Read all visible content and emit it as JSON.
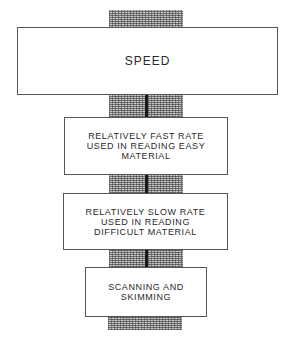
{
  "diagram": {
    "type": "vertical stack of boxes on a stippled spine",
    "boxes": [
      {
        "id": "speed",
        "label": "SPEED"
      },
      {
        "id": "fast",
        "label": "RELATIVELY FAST RATE\nUSED IN READING EASY\nMATERIAL"
      },
      {
        "id": "slow",
        "label": "RELATIVELY SLOW RATE\nUSED IN READING\nDIFFICULT MATERIAL"
      },
      {
        "id": "scan",
        "label": "SCANNING AND\nSKIMMING"
      }
    ],
    "colors": {
      "box_border": "#555555",
      "text": "#2a2a2a",
      "spine_stipple": "#bdbdbd",
      "stem": "#1a1a1a"
    }
  }
}
